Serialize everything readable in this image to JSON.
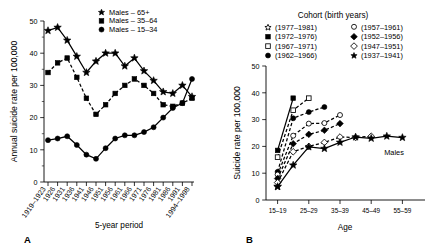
{
  "figure": {
    "panel_a_letter": "A",
    "panel_b_letter": "B"
  },
  "panelA": {
    "ylabel": "Annual suicide rate per 100,000",
    "xlabel": "5-year period",
    "letter": "A",
    "legend": [
      {
        "marker": "star-filled",
        "label": "Males – 65+"
      },
      {
        "marker": "square-filled",
        "label": "Males – 35–64"
      },
      {
        "marker": "circle-filled",
        "label": "Males – 15–34"
      }
    ],
    "yticks": [
      "0",
      "10",
      "20",
      "30",
      "40",
      "50"
    ],
    "xticks": [
      "1919–1923",
      "1926",
      "1931",
      "1936",
      "1941",
      "1946",
      "1951",
      "1956",
      "1961",
      "1966",
      "1971",
      "1976",
      "1981",
      "1986",
      "1991",
      "1994–1998"
    ]
  },
  "panelB": {
    "ylabel": "Suicide rate per 100,000",
    "xlabel": "Age",
    "letter": "B",
    "legend_title": "Cohort (birth years)",
    "annotation": "Males",
    "legend": [
      {
        "marker": "star-open",
        "label": "(1977–1981)"
      },
      {
        "marker": "square-filled",
        "label": "(1972–1976)"
      },
      {
        "marker": "square-open",
        "label": "(1967–1971)"
      },
      {
        "marker": "circle-filled",
        "label": "(1962–1966)"
      },
      {
        "marker": "circle-open",
        "label": "(1957–1961)"
      },
      {
        "marker": "diamond-filled",
        "label": "(1952–1956)"
      },
      {
        "marker": "diamond-open",
        "label": "(1947–1951)"
      },
      {
        "marker": "star-filled",
        "label": "(1937–1941)"
      }
    ],
    "yticks": [
      "0",
      "10",
      "20",
      "30",
      "40",
      "50"
    ],
    "xticks": [
      "15–19",
      "25–29",
      "35–39",
      "45–49",
      "55–59"
    ]
  },
  "chart_data": [
    {
      "type": "line",
      "title": "",
      "panel": "A",
      "xlabel": "5-year period",
      "ylabel": "Annual suicide rate per 100,000",
      "ylim": [
        0,
        52
      ],
      "grid": false,
      "legend_position": "top-center",
      "categories": [
        "1919–1923",
        "1924–1928",
        "1929–1933",
        "1934–1938",
        "1939–1943",
        "1944–1948",
        "1949–1953",
        "1954–1958",
        "1959–1963",
        "1964–1968",
        "1969–1973",
        "1974–1978",
        "1979–1983",
        "1984–1988",
        "1989–1993",
        "1994–1998"
      ],
      "tick_labels": [
        "1919–1923",
        "1926",
        "1931",
        "1936",
        "1941",
        "1946",
        "1951",
        "1956",
        "1961",
        "1966",
        "1971",
        "1976",
        "1981",
        "1986",
        "1991",
        "1994–1998"
      ],
      "series": [
        {
          "name": "Males – 65+",
          "marker": "star-filled",
          "linestyle": "solid",
          "values": [
            47.0,
            48.0,
            44.0,
            39.0,
            34.0,
            37.5,
            40.0,
            40.0,
            36.0,
            38.5,
            34.5,
            31.5,
            28.0,
            27.5,
            30.0,
            26.5
          ]
        },
        {
          "name": "Males – 35–64",
          "marker": "square-filled",
          "linestyle": "dashed",
          "values": [
            34.0,
            37.0,
            38.5,
            32.5,
            26.0,
            21.0,
            24.0,
            27.5,
            30.0,
            32.0,
            30.0,
            27.5,
            24.0,
            23.5,
            24.5,
            26.0
          ]
        },
        {
          "name": "Males – 15–34",
          "marker": "circle-filled",
          "linestyle": "solid",
          "values": [
            13.0,
            13.5,
            14.2,
            11.5,
            8.5,
            7.2,
            10.5,
            13.5,
            14.5,
            14.5,
            15.5,
            17.0,
            20.0,
            23.0,
            24.5,
            32.0
          ]
        }
      ]
    },
    {
      "type": "line",
      "title": "",
      "panel": "B",
      "xlabel": "Age",
      "ylabel": "Suicide rate per 100,000",
      "ylim": [
        0,
        52
      ],
      "grid": false,
      "legend_position": "top",
      "legend_title": "Cohort (birth years)",
      "annotation": "Males",
      "categories": [
        "15–19",
        "20–24",
        "25–29",
        "30–34",
        "35–39",
        "40–44",
        "45–49",
        "50–54",
        "55–59"
      ],
      "series": [
        {
          "name": "(1977–1981)",
          "marker": "star-open",
          "linestyle": "solid",
          "values": [
            5.0
          ]
        },
        {
          "name": "(1972–1976)",
          "marker": "square-filled",
          "linestyle": "solid",
          "values": [
            18.5,
            38.0
          ]
        },
        {
          "name": "(1967–1971)",
          "marker": "square-open",
          "linestyle": "dashed",
          "values": [
            16.0,
            33.5,
            38.0
          ]
        },
        {
          "name": "(1962–1966)",
          "marker": "circle-filled",
          "linestyle": "dashed",
          "values": [
            10.5,
            30.5,
            32.8,
            34.7
          ]
        },
        {
          "name": "(1957–1961)",
          "marker": "circle-open",
          "linestyle": "dashed",
          "values": [
            9.5,
            24.0,
            28.5,
            28.7,
            31.7
          ]
        },
        {
          "name": "(1952–1956)",
          "marker": "diamond-filled",
          "linestyle": "dashed",
          "values": [
            8.0,
            21.0,
            24.5,
            26.0,
            28.5
          ]
        },
        {
          "name": "(1947–1951)",
          "marker": "diamond-open",
          "linestyle": "dashed",
          "values": [
            6.5,
            18.0,
            20.0,
            21.5,
            23.5,
            23.3,
            23.8
          ]
        },
        {
          "name": "(1937–1941)",
          "marker": "star-filled",
          "linestyle": "solid",
          "values": [
            5.0,
            13.0,
            19.8,
            19.2,
            21.5,
            23.5,
            23.0,
            23.8,
            23.3
          ]
        }
      ]
    }
  ]
}
